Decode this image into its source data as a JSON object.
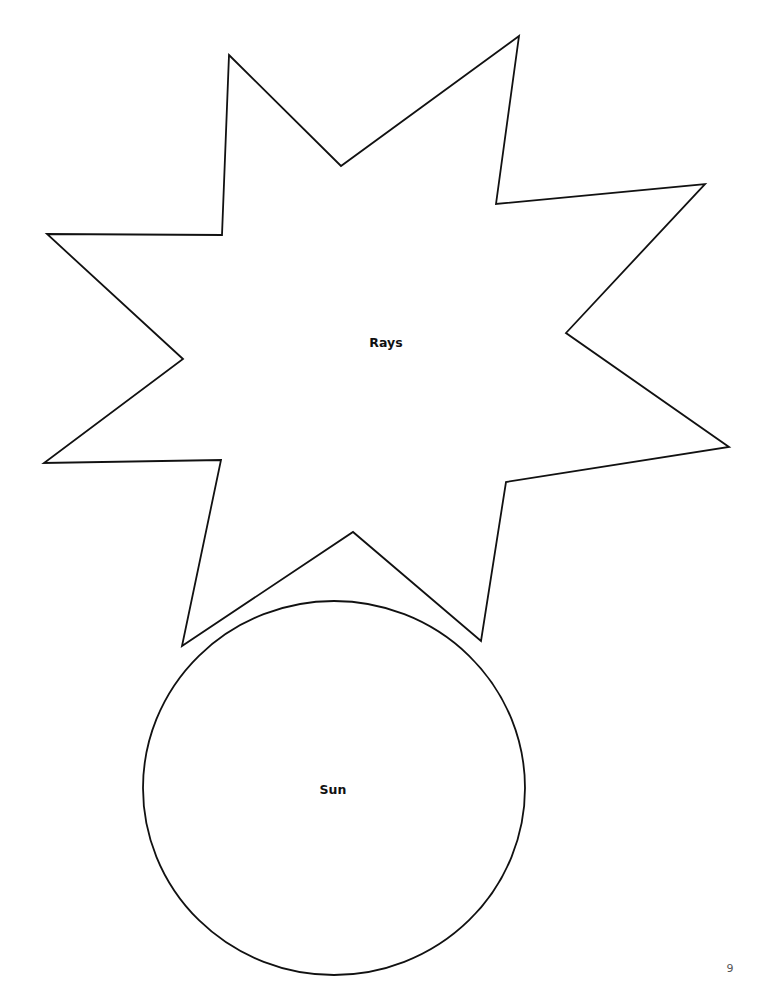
{
  "page": {
    "background": "#ffffff",
    "line_color": "#111111",
    "page_number": "9"
  },
  "shapes": {
    "rays": {
      "label": "Rays",
      "label_position": [
        386,
        343
      ],
      "points": "229,55 341,166 519,36 496,204 705,184 566,333 729,447 506,482 481,641 353,532 182,646 221,460 44,463 183,359 47,234 222,235"
    },
    "sun": {
      "label": "Sun",
      "label_position": [
        333,
        790
      ],
      "cx": 334,
      "cy": 788,
      "rx": 191,
      "ry": 187
    }
  }
}
